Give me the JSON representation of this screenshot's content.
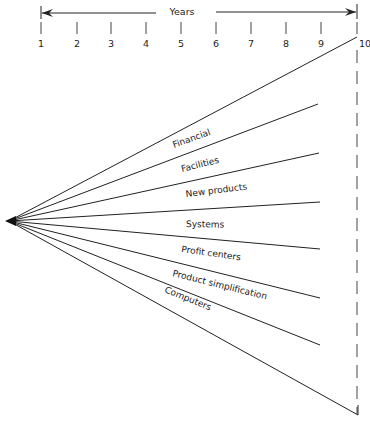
{
  "timeline": {
    "title": "Years",
    "ticks": [
      "1",
      "2",
      "3",
      "4",
      "5",
      "6",
      "7",
      "8",
      "9",
      "10"
    ]
  },
  "branches": [
    {
      "label": "Financial"
    },
    {
      "label": "Facilities"
    },
    {
      "label": "New products"
    },
    {
      "label": "Systems"
    },
    {
      "label": "Profit centers"
    },
    {
      "label": "Product simplification"
    },
    {
      "label": "Computers"
    }
  ],
  "colors": {
    "ink": "#222222",
    "background": "#ffffff"
  }
}
